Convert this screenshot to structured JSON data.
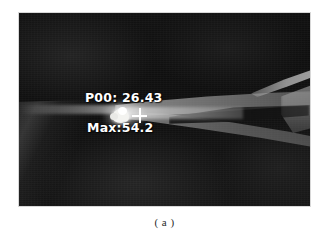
{
  "figure": {
    "caption": "( a )",
    "label": "a"
  },
  "thermal_image": {
    "type": "infrared-thermal-camera-frame",
    "background_color": "#121212",
    "overlay_text_color": "#ffffff",
    "hotspot_color": "#ffffff",
    "osd": {
      "point_label": "P00",
      "point_temperature": "P00: 26.43",
      "max_temperature": "Max:54.2"
    },
    "markers": {
      "crosshair": "point-measurement-crosshair"
    }
  }
}
